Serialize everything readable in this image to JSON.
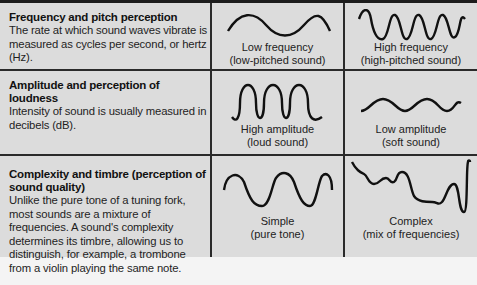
{
  "rows": [
    {
      "title": "Frequency and pitch perception",
      "description": "The rate at which sound waves vibrate is measured as cycles per second, or hertz (Hz).",
      "examples": [
        {
          "wave": "low-frequency-wave",
          "label": "Low frequency",
          "sublabel": "(low-pitched sound)"
        },
        {
          "wave": "high-frequency-wave",
          "label": "High frequency",
          "sublabel": "(high-pitched sound)"
        }
      ]
    },
    {
      "title": "Amplitude and perception of loudness",
      "description": "Intensity of sound is usually measured in decibels (dB).",
      "examples": [
        {
          "wave": "high-amplitude-wave",
          "label": "High amplitude",
          "sublabel": "(loud sound)"
        },
        {
          "wave": "low-amplitude-wave",
          "label": "Low amplitude",
          "sublabel": "(soft sound)"
        }
      ]
    },
    {
      "title": "Complexity and timbre (perception of sound quality)",
      "description": "Unlike the pure tone of a tuning fork, most sounds are a mixture of frequencies. A sound's complexity determines its timbre, allowing us to distinguish, for example, a trombone from a violin playing the same note.",
      "examples": [
        {
          "wave": "simple-wave",
          "label": "Simple",
          "sublabel": "(pure tone)"
        },
        {
          "wave": "complex-wave",
          "label": "Complex",
          "sublabel": "(mix of frequencies)"
        }
      ]
    }
  ],
  "colors": {
    "cell_background": "#dcdcdc",
    "grid_lines": "#2a2a2a",
    "page_background": "#f4f4f4"
  }
}
